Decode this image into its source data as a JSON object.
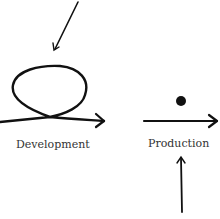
{
  "diagram": {
    "stages": [
      {
        "label": "Development",
        "marker": "loop"
      },
      {
        "label": "Production",
        "marker": "dot"
      }
    ],
    "colors": {
      "stroke": "#111111",
      "text": "#333333"
    }
  }
}
